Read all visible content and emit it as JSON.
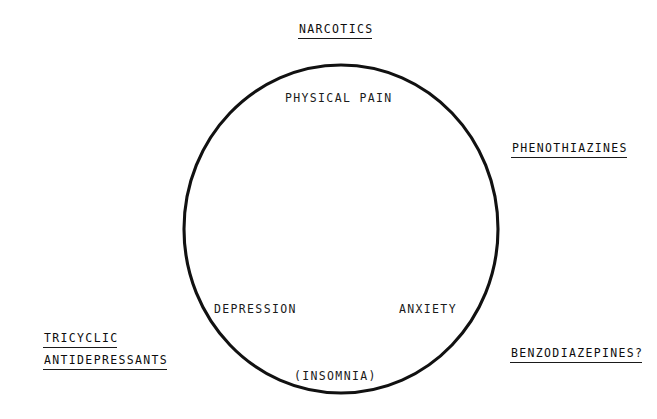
{
  "diagram": {
    "type": "single-set-overlap-diagram",
    "background_color": "#ffffff",
    "ink_color": "#111111",
    "circle": {
      "name": "symptom-circle",
      "center_x": 341,
      "center_y": 229,
      "radius_x": 157,
      "radius_y": 164,
      "stroke_color": "#111111",
      "stroke_width": 3,
      "fill": "none"
    },
    "outer_labels": [
      {
        "id": "narcotics",
        "text": "NARCOTICS",
        "underlined": true,
        "position": "top-center"
      },
      {
        "id": "phenothiazines",
        "text": "PHENOTHIAZINES",
        "underlined": true,
        "position": "right-upper"
      },
      {
        "id": "tricyclic",
        "text": "TRICYCLIC",
        "underlined": true,
        "position": "left-lower-line1"
      },
      {
        "id": "antidepressants",
        "text": "ANTIDEPRESSANTS",
        "underlined": true,
        "position": "left-lower-line2"
      },
      {
        "id": "benzodiazepines",
        "text": "BENZODIAZEPINES?",
        "underlined": true,
        "position": "right-lower"
      }
    ],
    "inner_labels": [
      {
        "id": "physical-pain",
        "text": "PHYSICAL PAIN",
        "underlined": false,
        "position": "inside-top"
      },
      {
        "id": "depression",
        "text": "DEPRESSION",
        "underlined": false,
        "position": "inside-lower-left"
      },
      {
        "id": "anxiety",
        "text": "ANXIETY",
        "underlined": false,
        "position": "inside-lower-right"
      },
      {
        "id": "insomnia",
        "text": "(INSOMNIA)",
        "underlined": false,
        "position": "inside-bottom-on-arc"
      }
    ]
  }
}
